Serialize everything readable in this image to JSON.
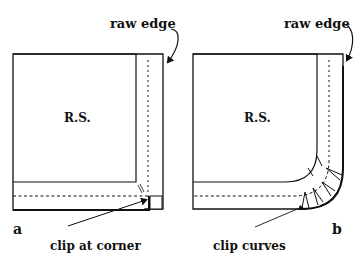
{
  "diagram": {
    "panels": [
      {
        "id": "a",
        "panel_label": "a",
        "fabric_label": "R.S.",
        "top_callout": "raw edge",
        "bottom_callout": "clip at corner"
      },
      {
        "id": "b",
        "panel_label": "b",
        "fabric_label": "R.S.",
        "top_callout": "raw edge",
        "bottom_callout": "clip curves"
      }
    ],
    "colors": {
      "line": "#111111",
      "background": "#ffffff"
    }
  }
}
